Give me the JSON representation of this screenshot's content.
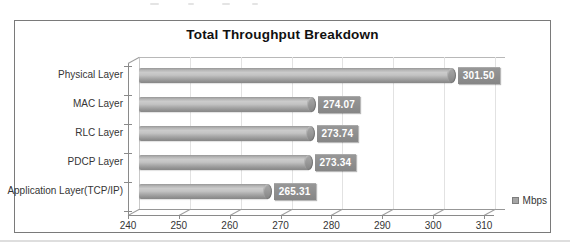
{
  "chart_data": {
    "type": "bar",
    "orientation": "horizontal",
    "style": "3d-cylinder",
    "title": "Total Throughput Breakdown",
    "categories": [
      "Physical Layer",
      "MAC Layer",
      "RLC Layer",
      "PDCP Layer",
      "Application Layer(TCP/IP)"
    ],
    "values": [
      301.5,
      274.07,
      273.74,
      273.34,
      265.31
    ],
    "value_labels": [
      "301.50",
      "274.07",
      "273.74",
      "273.34",
      "265.31"
    ],
    "xlabel": "",
    "ylabel": "",
    "xlim": [
      240,
      310
    ],
    "xticks": [
      240,
      250,
      260,
      270,
      280,
      290,
      300,
      310
    ],
    "grid": true,
    "legend": {
      "entries": [
        "Mbps"
      ],
      "position": "right"
    },
    "colors": {
      "bar": "#a8a8a8",
      "bar_highlight": "#cbcbcb",
      "bar_shadow": "#878787",
      "value_box": "#8e8e8e",
      "value_text": "#ffffff",
      "gridline": "#e2e2e2",
      "axis": "#8a8a8a",
      "frame_border": "#7a7a7a",
      "text": "#353535"
    }
  }
}
